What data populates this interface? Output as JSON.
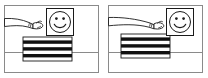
{
  "figure": {
    "panel_count": 2,
    "background_color": "#ffffff",
    "ink_color": "#1a1a1a",
    "frame_color": "#8a8a8a",
    "width_px": 208,
    "height_px": 78
  },
  "panels": [
    {
      "id": "panel-left",
      "label": "a",
      "frame": {
        "x": 4,
        "y": 5,
        "width": 95,
        "height": 68
      },
      "horizon_line": {
        "y": 52,
        "from_x": 4,
        "to_x": 99
      },
      "arm": {
        "name": "arm-reaching",
        "sleeve_cuff_x": 30,
        "hand_x": 40,
        "extended": false,
        "description": "short sleeved arm entering from left, hand near card"
      },
      "card": {
        "name": "smiley-card",
        "x": 46,
        "y": 8,
        "width": 28,
        "height": 28,
        "face": {
          "eyes": 2,
          "mouth": "smile",
          "expression": "happy"
        }
      },
      "striped_block": {
        "name": "striped-block",
        "x": 23,
        "y": 37,
        "width": 49,
        "height": 24,
        "stripe_count": 7,
        "stripe_colors": [
          "#ffffff",
          "#111111"
        ],
        "orientation": "horizontal"
      }
    },
    {
      "id": "panel-right",
      "label": "b",
      "frame": {
        "x": 4,
        "y": 5,
        "width": 95,
        "height": 68
      },
      "horizon_line": {
        "y": 52,
        "from_x": 4,
        "to_x": 99
      },
      "arm": {
        "name": "arm-reaching",
        "sleeve_cuff_x": 48,
        "hand_x": 58,
        "extended": true,
        "description": "long sleeved arm entering from left, hand touching card"
      },
      "card": {
        "name": "smiley-card",
        "x": 62,
        "y": 8,
        "width": 28,
        "height": 28,
        "face": {
          "eyes": 2,
          "mouth": "smile",
          "expression": "happy"
        }
      },
      "striped_block": {
        "name": "striped-block",
        "x": 17,
        "y": 34,
        "width": 49,
        "height": 24,
        "stripe_count": 7,
        "stripe_colors": [
          "#ffffff",
          "#111111"
        ],
        "orientation": "horizontal"
      }
    }
  ]
}
